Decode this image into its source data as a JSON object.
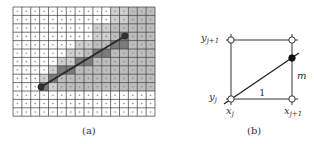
{
  "panel_a": {
    "caption": "(a)",
    "grid": {
      "cols": 16,
      "rows": 13,
      "left": 13,
      "top": 7,
      "cell_w": 8.875,
      "cell_h": 8.4
    },
    "light_cells_by_row": [
      [
        11,
        15
      ],
      [
        11,
        15
      ],
      [
        9,
        15
      ],
      [
        9,
        15
      ],
      [
        7,
        15
      ],
      [
        6,
        15
      ],
      [
        5,
        15
      ],
      [
        4,
        15
      ],
      [
        3,
        15
      ],
      [
        3,
        15
      ],
      [],
      [],
      []
    ],
    "dark_cells": [
      [
        12,
        3
      ],
      [
        11,
        4
      ],
      [
        12,
        4
      ],
      [
        9,
        5
      ],
      [
        10,
        5
      ],
      [
        7,
        6
      ],
      [
        8,
        6
      ],
      [
        5,
        7
      ],
      [
        6,
        7
      ],
      [
        4,
        8
      ],
      [
        3,
        9
      ]
    ],
    "line": {
      "x1": 41,
      "y1": 87,
      "x2": 125,
      "y2": 36
    },
    "start_point": {
      "x": 41,
      "y": 87
    },
    "end_point": {
      "x": 125,
      "y": 36
    }
  },
  "panel_b": {
    "caption": "(b)",
    "labels": {
      "y_top_base": "y",
      "y_top_sub": "j+1",
      "y_bottom_base": "y",
      "y_bottom_sub": "j",
      "x_left_base": "x",
      "x_left_sub": "j",
      "x_right_base": "x",
      "x_right_sub": "j+1",
      "run": "1",
      "slope": "m"
    }
  },
  "colors": {
    "grid_line": "#3a3a3a",
    "light_fill": "#cfcfcf",
    "medium_fill": "#bdbdbd",
    "dark_fill": "#7a7a7a",
    "line": "#2a2a2a"
  }
}
